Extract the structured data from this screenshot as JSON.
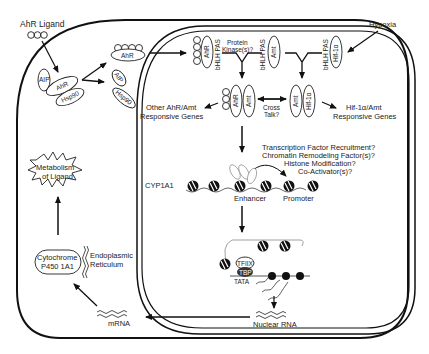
{
  "diagram": {
    "cytoplasm": {
      "ligand_label": "AhR Ligand",
      "cytosolic_complex": [
        "AIP",
        "AhR",
        "Hsp90"
      ],
      "ligand_bound_receptor": "AhR",
      "released_chaperones": [
        "AIP",
        "Hsp90"
      ],
      "metabolism_label_1": "Metabolism",
      "metabolism_label_2": "of Ligand",
      "cyp_label_1": "Cytochrome",
      "cyp_label_2": "P450 1A1",
      "er_label_1": "Endoplasmic",
      "er_label_2": "Reticulum",
      "mrna_label": "mRNA"
    },
    "nucleus": {
      "ahr_nuclear": "AhR",
      "bhlh_pas_1": "bHLH PAS",
      "protein_kinase_1": "Protein",
      "protein_kinase_2": "Kinase(s)?",
      "amt_1": "Amt",
      "bhlh_pas_2": "bHLH PAS",
      "hif_top": "Hif-1α",
      "bhlh_pas_3": "bHLH PAS",
      "hypoxia_label": "Hypoxia",
      "dimer_left": [
        "AhR",
        "Amt"
      ],
      "dimer_right": [
        "Amt",
        "Hif-1α"
      ],
      "cross_talk_1": "Cross",
      "cross_talk_2": "Talk?",
      "other_genes_1": "Other AhR/Amt",
      "other_genes_2": "Responsive Genes",
      "hif_genes_1": "Hif-1α/Amt",
      "hif_genes_2": "Responsive Genes",
      "questions": [
        "Transcription Factor Recruitment?",
        "Chromatin Remodeling Factor(s)?",
        "Histone Modification?",
        "Co-Activator(s)?"
      ],
      "gene_label": "CYP1A1",
      "enhancer_label": "Enhancer",
      "promoter_label": "Promoter",
      "tfiix_label": "TFIIX",
      "tbp_label": "TBP",
      "tata_label": "TATA",
      "nuclear_rna_label": "Nuclear RNA"
    }
  }
}
